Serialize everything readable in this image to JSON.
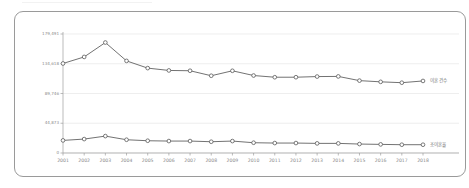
{
  "chart_data": {
    "type": "line",
    "title": "",
    "subtitle": "",
    "xlabel": "",
    "ylabel": "",
    "grid": true,
    "legend_position": "right-inline",
    "x": [
      "2001",
      "2002",
      "2003",
      "2004",
      "2005",
      "2006",
      "2007",
      "2008",
      "2009",
      "2010",
      "2011",
      "2012",
      "2013",
      "2014",
      "2015",
      "2016",
      "2017",
      "2018"
    ],
    "ylim": [
      0,
      179491
    ],
    "yticks": [
      0,
      44873,
      89746,
      134618,
      179491
    ],
    "ytick_labels": [
      "0",
      "44,873",
      "89,746",
      "134,618",
      "179,491"
    ],
    "series": [
      {
        "name": "이혼 건수",
        "label_x": "2018",
        "values": [
          135014,
          144910,
          166617,
          138932,
          128035,
          124524,
          124072,
          116535,
          123999,
          116858,
          114284,
          114316,
          115292,
          115510,
          109153,
          107328,
          106032,
          108684
        ]
      },
      {
        "name": "조이혼율",
        "label_x": "2018",
        "values": [
          19000,
          21000,
          25500,
          20000,
          18500,
          18000,
          18000,
          17000,
          18000,
          15500,
          15000,
          15000,
          14500,
          14500,
          13500,
          13000,
          12500,
          12500
        ]
      }
    ]
  },
  "legend": {
    "items": [
      {
        "label": "이혼 건수"
      },
      {
        "label": "조이혼율"
      }
    ]
  },
  "colors": {
    "line": "#595959",
    "marker_fill": "#ffffff",
    "grid": "#e3e3e3",
    "axis": "#9e9e9e",
    "tick_text": "#8a8a8a",
    "legend_text": "#6f6f6f",
    "card_border": "#9a9a9a",
    "background": "#ffffff"
  }
}
